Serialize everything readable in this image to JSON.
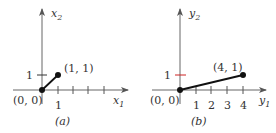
{
  "panels": [
    {
      "id": "a",
      "caption": "(a)",
      "x_axis_label": "x",
      "x_axis_sub": "1",
      "y_axis_label": "x",
      "y_axis_sub": "2",
      "origin_label": "(0, 0)",
      "point_label": "(1, 1)",
      "y_tick_label": "1",
      "x_tick_labels": [
        "1"
      ],
      "y_tick_color": "#333333"
    },
    {
      "id": "b",
      "caption": "(b)",
      "x_axis_label": "y",
      "x_axis_sub": "1",
      "y_axis_label": "y",
      "y_axis_sub": "2",
      "origin_label": "(0, 0)",
      "point_label": "(4, 1)",
      "y_tick_label": "1",
      "x_tick_labels": [
        "1",
        "2",
        "3",
        "4"
      ],
      "y_tick_color": "#cc2222"
    }
  ]
}
